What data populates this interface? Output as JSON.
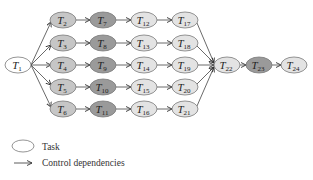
{
  "diagram": {
    "colors": {
      "white": "#ffffff",
      "light": "#e3e3e3",
      "medium": "#c6c6c6",
      "dark": "#9a9a9a",
      "stroke": "#7a7a7a"
    },
    "nodes": [
      {
        "id": "T1",
        "sub": "1",
        "x": 18,
        "y": 65,
        "shade": "white"
      },
      {
        "id": "T2",
        "sub": "2",
        "x": 63,
        "y": 20,
        "shade": "medium"
      },
      {
        "id": "T3",
        "sub": "3",
        "x": 63,
        "y": 43,
        "shade": "medium"
      },
      {
        "id": "T4",
        "sub": "4",
        "x": 63,
        "y": 65,
        "shade": "medium"
      },
      {
        "id": "T5",
        "sub": "5",
        "x": 63,
        "y": 87,
        "shade": "medium"
      },
      {
        "id": "T6",
        "sub": "6",
        "x": 63,
        "y": 109,
        "shade": "medium"
      },
      {
        "id": "T7",
        "sub": "7",
        "x": 103,
        "y": 20,
        "shade": "dark"
      },
      {
        "id": "T8",
        "sub": "8",
        "x": 103,
        "y": 43,
        "shade": "dark"
      },
      {
        "id": "T9",
        "sub": "9",
        "x": 103,
        "y": 65,
        "shade": "dark"
      },
      {
        "id": "T10",
        "sub": "10",
        "x": 103,
        "y": 87,
        "shade": "dark"
      },
      {
        "id": "T11",
        "sub": "11",
        "x": 103,
        "y": 109,
        "shade": "dark"
      },
      {
        "id": "T12",
        "sub": "12",
        "x": 144,
        "y": 20,
        "shade": "light"
      },
      {
        "id": "T13",
        "sub": "13",
        "x": 144,
        "y": 43,
        "shade": "light"
      },
      {
        "id": "T14",
        "sub": "14",
        "x": 144,
        "y": 65,
        "shade": "light"
      },
      {
        "id": "T15",
        "sub": "15",
        "x": 144,
        "y": 87,
        "shade": "light"
      },
      {
        "id": "T16",
        "sub": "16",
        "x": 144,
        "y": 109,
        "shade": "light"
      },
      {
        "id": "T17",
        "sub": "17",
        "x": 185,
        "y": 20,
        "shade": "light"
      },
      {
        "id": "T18",
        "sub": "18",
        "x": 185,
        "y": 43,
        "shade": "light"
      },
      {
        "id": "T19",
        "sub": "19",
        "x": 185,
        "y": 65,
        "shade": "light"
      },
      {
        "id": "T20",
        "sub": "20",
        "x": 185,
        "y": 87,
        "shade": "light"
      },
      {
        "id": "T21",
        "sub": "21",
        "x": 185,
        "y": 109,
        "shade": "light"
      },
      {
        "id": "T22",
        "sub": "22",
        "x": 227,
        "y": 65,
        "shade": "light"
      },
      {
        "id": "T23",
        "sub": "23",
        "x": 259,
        "y": 65,
        "shade": "dark"
      },
      {
        "id": "T24",
        "sub": "24",
        "x": 294,
        "y": 65,
        "shade": "light"
      }
    ],
    "edges": [
      [
        "T1",
        "T2"
      ],
      [
        "T1",
        "T3"
      ],
      [
        "T1",
        "T4"
      ],
      [
        "T1",
        "T5"
      ],
      [
        "T1",
        "T6"
      ],
      [
        "T2",
        "T7"
      ],
      [
        "T3",
        "T8"
      ],
      [
        "T4",
        "T9"
      ],
      [
        "T5",
        "T10"
      ],
      [
        "T6",
        "T11"
      ],
      [
        "T7",
        "T12"
      ],
      [
        "T8",
        "T13"
      ],
      [
        "T9",
        "T14"
      ],
      [
        "T10",
        "T15"
      ],
      [
        "T11",
        "T16"
      ],
      [
        "T12",
        "T17"
      ],
      [
        "T13",
        "T18"
      ],
      [
        "T14",
        "T19"
      ],
      [
        "T15",
        "T20"
      ],
      [
        "T16",
        "T21"
      ],
      [
        "T17",
        "T22"
      ],
      [
        "T18",
        "T22"
      ],
      [
        "T19",
        "T22"
      ],
      [
        "T20",
        "T22"
      ],
      [
        "T21",
        "T22"
      ],
      [
        "T22",
        "T23"
      ],
      [
        "T23",
        "T24"
      ]
    ]
  },
  "legend": {
    "task_label": "Task",
    "dependency_label": "Control dependencies"
  }
}
